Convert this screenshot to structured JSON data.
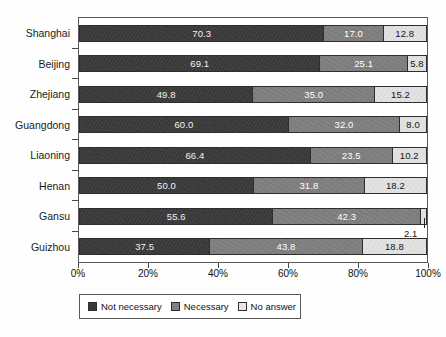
{
  "chart_data": {
    "type": "bar",
    "subtype": "horizontal-stacked-100",
    "title": "",
    "xlabel": "",
    "ylabel": "",
    "xlim": [
      0,
      100
    ],
    "grid": false,
    "legend_position": "bottom-left",
    "categories": [
      "Shanghai",
      "Beijing",
      "Zhejiang",
      "Guangdong",
      "Liaoning",
      "Henan",
      "Gansu",
      "Guizhou"
    ],
    "tick_labels": [
      "0%",
      "20%",
      "40%",
      "60%",
      "80%",
      "100%"
    ],
    "tick_values": [
      0,
      20,
      40,
      60,
      80,
      100
    ],
    "series": [
      {
        "name": "Not necessary",
        "color": "#3a3a3a",
        "values": [
          70.3,
          69.1,
          49.8,
          60.0,
          66.4,
          50.0,
          55.6,
          37.5
        ],
        "labels": [
          "70.3",
          "69.1",
          "49.8",
          "60.0",
          "66.4",
          "50.0",
          "55.6",
          "37.5"
        ]
      },
      {
        "name": "Necessary",
        "color": "#7f7f7f",
        "values": [
          17.0,
          25.1,
          35.0,
          32.0,
          23.5,
          31.8,
          42.3,
          43.8
        ],
        "labels": [
          "17.0",
          "25.1",
          "35.0",
          "32.0",
          "23.5",
          "31.8",
          "42.3",
          "43.8"
        ]
      },
      {
        "name": "No answer",
        "color": "#e2e2e2",
        "values": [
          12.8,
          5.8,
          15.2,
          8.0,
          10.2,
          18.2,
          2.1,
          18.8
        ],
        "labels": [
          "12.8",
          "5.8",
          "15.2",
          "8.0",
          "10.2",
          "18.2",
          "2.1",
          "18.8"
        ]
      }
    ],
    "annotations": [
      {
        "text": "2.1",
        "for_category": "Gansu",
        "for_series": "No answer",
        "placement": "outside-below-right"
      }
    ]
  },
  "legend": {
    "items": [
      {
        "label": "Not necessary",
        "color": "#3a3a3a"
      },
      {
        "label": "Necessary",
        "color": "#7f7f7f"
      },
      {
        "label": "No answer",
        "color": "#e8e8e8"
      }
    ]
  }
}
